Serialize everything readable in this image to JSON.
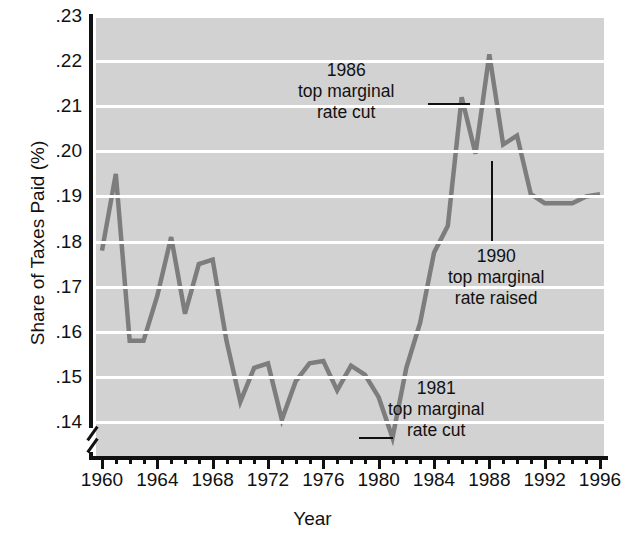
{
  "chart_data": {
    "type": "line",
    "title": "",
    "xlabel": "Year",
    "ylabel": "Share of Taxes Paid (%)",
    "xlim": [
      1960,
      1996
    ],
    "ylim": [
      0.135,
      0.23
    ],
    "ytick_labels": [
      ".23",
      ".22",
      ".21",
      ".20",
      ".19",
      ".18",
      ".17",
      ".16",
      ".15",
      ".14"
    ],
    "ytick_values": [
      0.23,
      0.22,
      0.21,
      0.2,
      0.19,
      0.18,
      0.17,
      0.16,
      0.15,
      0.14
    ],
    "xtick_labels": [
      "1960",
      "1964",
      "1968",
      "1972",
      "1976",
      "1980",
      "1984",
      "1988",
      "1992",
      "1996"
    ],
    "xtick_values": [
      1960,
      1964,
      1968,
      1972,
      1976,
      1980,
      1984,
      1988,
      1992,
      1996
    ],
    "xtick_minor_step": 1,
    "grid": "horizontal-white",
    "legend": "none",
    "axis_break": "y-axis below .14",
    "x": [
      1960,
      1961,
      1962,
      1963,
      1964,
      1965,
      1966,
      1967,
      1968,
      1969,
      1970,
      1971,
      1972,
      1973,
      1974,
      1975,
      1976,
      1977,
      1978,
      1979,
      1980,
      1981,
      1982,
      1983,
      1984,
      1985,
      1986,
      1987,
      1988,
      1989,
      1990,
      1991,
      1992,
      1993,
      1994,
      1995,
      1996
    ],
    "values": [
      0.178,
      0.195,
      0.158,
      0.158,
      0.168,
      0.181,
      0.164,
      0.175,
      0.176,
      0.158,
      0.1445,
      0.152,
      0.153,
      0.1405,
      0.149,
      0.153,
      0.1535,
      0.147,
      0.1525,
      0.1505,
      0.1455,
      0.1365,
      0.152,
      0.162,
      0.1775,
      0.1835,
      0.212,
      0.1995,
      0.2215,
      0.2015,
      0.2035,
      0.1905,
      0.1885,
      0.1885,
      0.1885,
      0.19,
      0.1905
    ],
    "series_color": "#7d7d7d",
    "plot_background": "#d2d2d2",
    "gridline_color": "#ffffff",
    "annotations": [
      {
        "id": "anno-1986",
        "lines": [
          "1986",
          "top marginal",
          "rate cut"
        ],
        "leader": "horizontal-right",
        "points_to_year": 1986
      },
      {
        "id": "anno-1990",
        "lines": [
          "1990",
          "top marginal",
          "rate raised"
        ],
        "leader": "vertical-up",
        "points_to_year": 1990
      },
      {
        "id": "anno-1981",
        "lines": [
          "1981",
          "top marginal",
          "rate cut"
        ],
        "leader": "horizontal-left",
        "points_to_year": 1981
      }
    ]
  },
  "axes": {
    "y_title": "Share of Taxes Paid (%)",
    "x_title": "Year"
  },
  "anno_1986": {
    "l1": "1986",
    "l2": "top marginal",
    "l3": "rate cut"
  },
  "anno_1990": {
    "l1": "1990",
    "l2": "top marginal",
    "l3": "rate raised"
  },
  "anno_1981": {
    "l1": "1981",
    "l2": "top marginal",
    "l3": "rate cut"
  }
}
